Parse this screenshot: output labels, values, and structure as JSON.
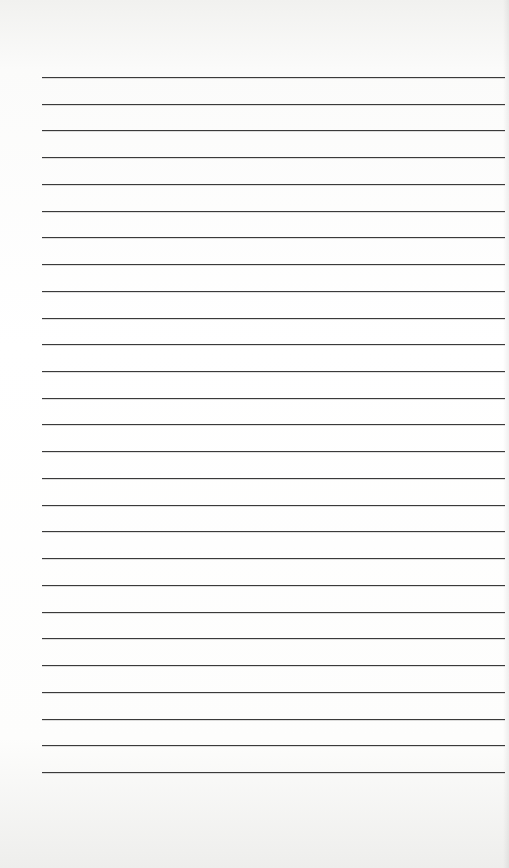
{
  "page": {
    "type": "lined-paper",
    "background_color": "#ffffff",
    "rule_color": "#3a3a3a",
    "rule_count": 27,
    "first_rule_y": 77,
    "rule_spacing": 26.73,
    "rule_left": 42,
    "rule_width": 463
  }
}
